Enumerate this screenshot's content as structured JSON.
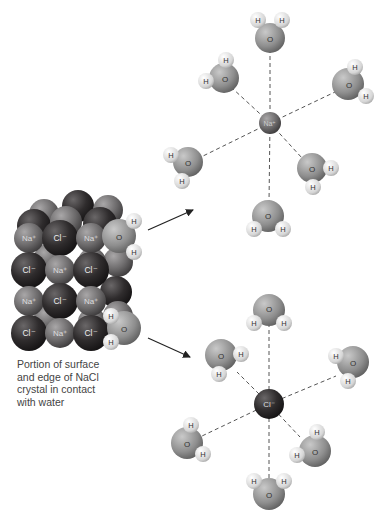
{
  "caption": {
    "lines": [
      "Portion of surface",
      "and edge of NaCl",
      "crystal in contact",
      "with water"
    ]
  },
  "labels": {
    "sodium": "Na⁺",
    "chloride": "Cl⁻",
    "oxygen": "O",
    "hydrogen": "H"
  },
  "colors": {
    "chloride_ion": "#2e2b2c",
    "sodium_ion": "#6d6b6c",
    "oxygen": "#8f8f8f",
    "hydrogen": "#d8d8d8",
    "bond_dash": "#555555",
    "arrow": "#222222",
    "background": "#ffffff"
  },
  "hydrated_sodium": {
    "center": [
      270,
      123
    ],
    "waters": [
      {
        "o": [
          270,
          38
        ],
        "h": [
          [
            258,
            20
          ],
          [
            282,
            20
          ]
        ]
      },
      {
        "o": [
          222,
          78
        ],
        "h": [
          [
            226,
            60
          ],
          [
            205,
            82
          ]
        ]
      },
      {
        "o": [
          348,
          82
        ],
        "h": [
          [
            355,
            66
          ],
          [
            366,
            96
          ]
        ]
      },
      {
        "o": [
          188,
          162
        ],
        "h": [
          [
            171,
            155
          ],
          [
            182,
            181
          ]
        ]
      },
      {
        "o": [
          312,
          167
        ],
        "h": [
          [
            330,
            167
          ],
          [
            313,
            187
          ]
        ]
      },
      {
        "o": [
          268,
          215
        ],
        "h": [
          [
            254,
            230
          ],
          [
            283,
            230
          ]
        ]
      }
    ]
  },
  "hydrated_chloride": {
    "center": [
      269,
      404
    ],
    "waters": [
      {
        "o": [
          269,
          312
        ],
        "h": [
          [
            254,
            323
          ],
          [
            284,
            323
          ]
        ]
      },
      {
        "o": [
          223,
          356
        ],
        "h": [
          [
            241,
            354
          ],
          [
            219,
            375
          ]
        ]
      },
      {
        "o": [
          352,
          362
        ],
        "h": [
          [
            335,
            356
          ],
          [
            349,
            381
          ]
        ]
      },
      {
        "o": [
          188,
          441
        ],
        "h": [
          [
            191,
            424
          ],
          [
            202,
            454
          ]
        ]
      },
      {
        "o": [
          313,
          450
        ],
        "h": [
          [
            317,
            432
          ],
          [
            297,
            455
          ]
        ]
      },
      {
        "o": [
          268,
          494
        ],
        "h": [
          [
            254,
            482
          ],
          [
            283,
            482
          ]
        ]
      }
    ]
  },
  "crystal": {
    "front_rows": [
      [
        "Na+",
        "Cl-",
        "Na+"
      ],
      [
        "Cl-",
        "Na+",
        "Cl-"
      ],
      [
        "Na+",
        "Cl-",
        "Na+"
      ],
      [
        "Cl-",
        "Na+",
        "Cl-"
      ]
    ],
    "surface_waters": [
      {
        "o": [
          119,
          236
        ],
        "h": [
          [
            134,
            221
          ],
          [
            134,
            252
          ]
        ]
      },
      {
        "o": [
          121,
          327
        ],
        "h": [
          [
            111,
            316
          ],
          [
            111,
            342
          ]
        ]
      }
    ]
  },
  "arrows": [
    {
      "from": [
        148,
        230
      ],
      "to": [
        193,
        210
      ]
    },
    {
      "from": [
        148,
        338
      ],
      "to": [
        190,
        357
      ]
    }
  ]
}
